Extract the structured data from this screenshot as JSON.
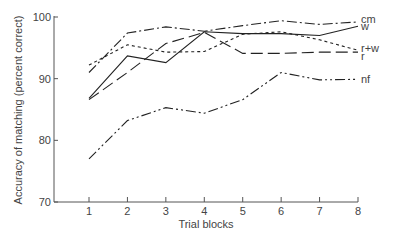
{
  "chart_data": {
    "type": "line",
    "title": "",
    "xlabel": "Trial blocks",
    "ylabel": "Accuracy of matching (percent correct)",
    "x": [
      1,
      2,
      3,
      4,
      5,
      6,
      7,
      8
    ],
    "xticks": [
      "1",
      "2",
      "3",
      "4",
      "5",
      "6",
      "7",
      "8"
    ],
    "yticks": [
      "70",
      "80",
      "90",
      "100"
    ],
    "ylim": [
      70,
      100
    ],
    "xlim": [
      0,
      8.3
    ],
    "grid": false,
    "legend_position": "inline-right",
    "series": [
      {
        "name": "cm",
        "dash": "dash-dot",
        "values": [
          91.0,
          97.4,
          98.4,
          97.7,
          98.6,
          99.4,
          98.8,
          99.2
        ]
      },
      {
        "name": "w",
        "dash": "solid",
        "values": [
          86.8,
          93.7,
          92.6,
          97.6,
          97.3,
          97.3,
          97.0,
          98.5
        ]
      },
      {
        "name": "r+w",
        "dash": "dotted",
        "values": [
          92.2,
          95.5,
          94.3,
          94.4,
          97.2,
          97.6,
          96.3,
          94.6
        ]
      },
      {
        "name": "r",
        "dash": "long-dash",
        "values": [
          86.6,
          91.0,
          95.7,
          97.5,
          94.1,
          94.1,
          94.3,
          94.3
        ]
      },
      {
        "name": "nf",
        "dash": "dash-dot-dot",
        "values": [
          77.0,
          83.2,
          85.3,
          84.4,
          86.6,
          91.0,
          89.8,
          89.9
        ]
      }
    ]
  }
}
